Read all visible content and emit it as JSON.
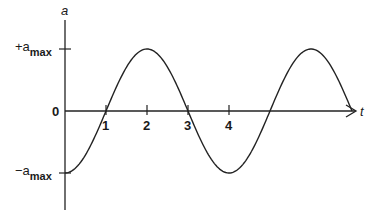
{
  "chart_data": {
    "type": "line",
    "title": "",
    "xlabel": "t",
    "ylabel": "a",
    "x_ticks": [
      "1",
      "2",
      "3",
      "4"
    ],
    "y_ticks": [
      {
        "value": 1,
        "label_prefix": "+a",
        "label_sub": "max"
      },
      {
        "value": 0,
        "label_prefix": "0",
        "label_sub": ""
      },
      {
        "value": -1,
        "label_prefix": "−a",
        "label_sub": "max"
      }
    ],
    "xlim": [
      0,
      7.5
    ],
    "ylim": [
      -1,
      1
    ],
    "series": [
      {
        "name": "a(t) = -a_max cos(pi t / 2)",
        "function": "-cos",
        "period": 4,
        "amplitude": 1,
        "x_start": 0,
        "x_end": 7
      }
    ],
    "grid": false
  }
}
